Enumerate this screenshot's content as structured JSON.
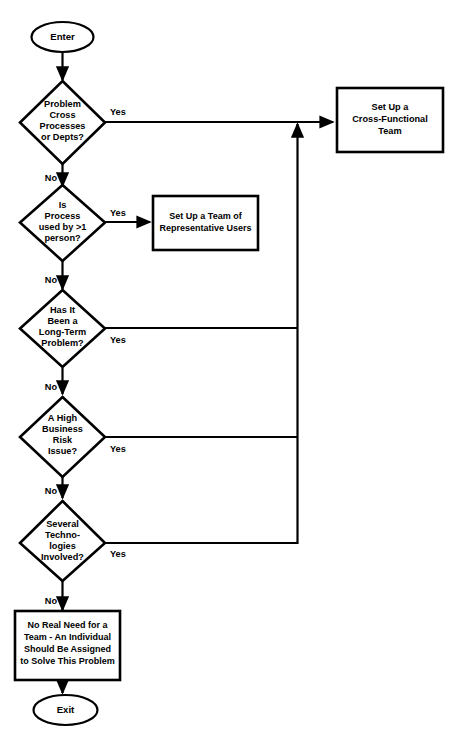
{
  "diagram": {
    "type": "flowchart",
    "background_color": "#ffffff",
    "line_color": "#000000",
    "shape_fill": "#ffffff"
  },
  "nodes": {
    "start": {
      "shape": "oval",
      "label": "Enter"
    },
    "decision1": {
      "shape": "diamond",
      "lines": [
        "Problem",
        "Cross",
        "Processes",
        "or Depts?"
      ]
    },
    "decision2": {
      "shape": "diamond",
      "lines": [
        "Is",
        "Process",
        "used by >1",
        "person?"
      ]
    },
    "decision3": {
      "shape": "diamond",
      "lines": [
        "Has It",
        "Been a",
        "Long-Term",
        "Problem?"
      ]
    },
    "decision4": {
      "shape": "diamond",
      "lines": [
        "A High",
        "Business",
        "Risk",
        "Issue?"
      ]
    },
    "decision5": {
      "shape": "diamond",
      "lines": [
        "Several",
        "Techno-",
        "logies",
        "Involved?"
      ]
    },
    "process_cross_functional": {
      "shape": "rectangle",
      "lines": [
        "Set Up a",
        "Cross-Functional",
        "Team"
      ]
    },
    "process_rep_users": {
      "shape": "rectangle",
      "lines": [
        "Set Up a Team of",
        "Representative Users"
      ]
    },
    "process_no_team": {
      "shape": "rectangle",
      "lines": [
        "No Real Need for a",
        "Team - An Individual",
        "Should Be Assigned",
        "to Solve This Problem"
      ]
    },
    "end": {
      "shape": "oval",
      "label": "Exit"
    }
  },
  "edges": {
    "d1_yes": "Yes",
    "d1_no": "No",
    "d2_yes": "Yes",
    "d2_no": "No",
    "d3_yes": "Yes",
    "d3_no": "No",
    "d4_yes": "Yes",
    "d4_no": "No",
    "d5_yes": "Yes",
    "d5_no": "No"
  }
}
